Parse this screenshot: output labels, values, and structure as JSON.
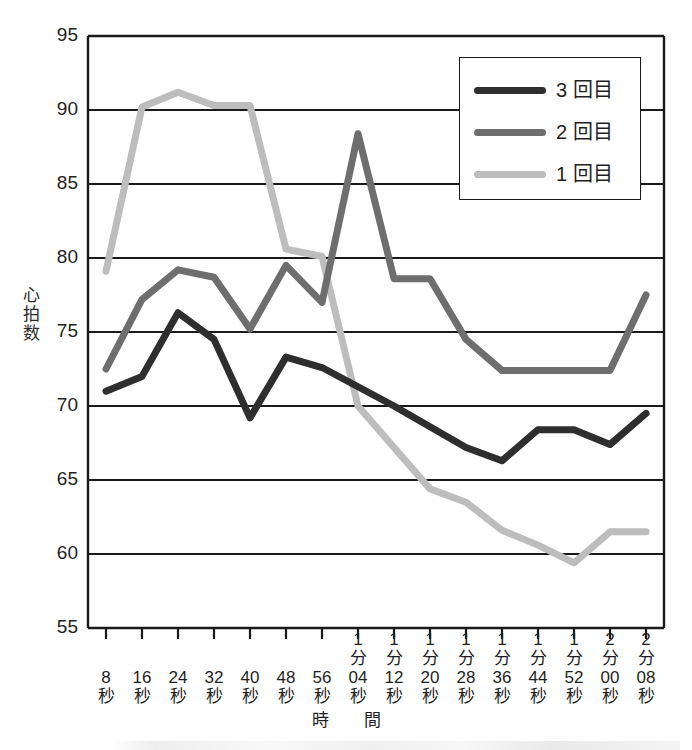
{
  "chart_data": {
    "type": "line",
    "title": "",
    "xlabel": "時　間",
    "ylabel": "心拍数",
    "ylim": [
      55,
      95
    ],
    "ytick_values": [
      95,
      90,
      85,
      80,
      75,
      70,
      65,
      60,
      55
    ],
    "grid": true,
    "grid_axis": "y",
    "legend_position": "top-right",
    "categories": [
      "8秒",
      "16秒",
      "24秒",
      "32秒",
      "40秒",
      "48秒",
      "56秒",
      "1分04秒",
      "1分12秒",
      "1分20秒",
      "1分28秒",
      "1分36秒",
      "1分44秒",
      "1分52秒",
      "2分00秒",
      "2分08秒"
    ],
    "series": [
      {
        "name": "3 回目",
        "color": "#2e2e2e",
        "values": [
          71.0,
          72.0,
          76.3,
          74.5,
          69.2,
          73.3,
          72.6,
          71.3,
          70.0,
          68.6,
          67.2,
          66.3,
          68.4,
          68.4,
          67.4,
          69.5
        ]
      },
      {
        "name": "2 回目",
        "color": "#6e6e6e",
        "values": [
          72.5,
          77.2,
          79.2,
          78.7,
          75.2,
          79.5,
          77.0,
          88.4,
          78.6,
          78.6,
          74.5,
          72.4,
          72.4,
          72.4,
          72.4,
          77.5
        ]
      },
      {
        "name": "1 回目",
        "color": "#bdbdbd",
        "values": [
          79.1,
          90.2,
          91.2,
          90.3,
          90.3,
          80.6,
          80.1,
          70.0,
          67.2,
          64.4,
          63.5,
          61.6,
          60.6,
          59.4,
          61.5,
          61.5
        ]
      }
    ]
  },
  "xtick_label_lines": [
    [
      "8",
      "秒"
    ],
    [
      "16",
      "秒"
    ],
    [
      "24",
      "秒"
    ],
    [
      "32",
      "秒"
    ],
    [
      "40",
      "秒"
    ],
    [
      "48",
      "秒"
    ],
    [
      "56",
      "秒"
    ],
    [
      "1",
      "分",
      "04",
      "秒"
    ],
    [
      "1",
      "分",
      "12",
      "秒"
    ],
    [
      "1",
      "分",
      "20",
      "秒"
    ],
    [
      "1",
      "分",
      "28",
      "秒"
    ],
    [
      "1",
      "分",
      "36",
      "秒"
    ],
    [
      "1",
      "分",
      "44",
      "秒"
    ],
    [
      "1",
      "分",
      "52",
      "秒"
    ],
    [
      "2",
      "分",
      "00",
      "秒"
    ],
    [
      "2",
      "分",
      "08",
      "秒"
    ]
  ],
  "ylabel_chars": [
    "心",
    "拍",
    "数"
  ],
  "legend": {
    "entries": [
      {
        "label": "3 回目",
        "color": "#2e2e2e"
      },
      {
        "label": "2 回目",
        "color": "#6e6e6e"
      },
      {
        "label": "1 回目",
        "color": "#bdbdbd"
      }
    ]
  },
  "colors": {
    "axis": "#1a1a1a",
    "grid": "#1a1a1a",
    "background": "#ffffff",
    "series_3kaime": "#2e2e2e",
    "series_2kaime": "#6e6e6e",
    "series_1kaime": "#bdbdbd"
  }
}
